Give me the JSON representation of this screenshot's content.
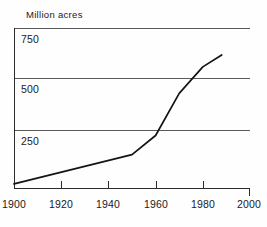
{
  "chart_data": {
    "type": "line",
    "title": "Million acres",
    "xlabel": "",
    "ylabel": "Million acres",
    "xlim": [
      1900,
      2000
    ],
    "ylim": [
      0,
      875
    ],
    "grid": true,
    "legend": null,
    "x_ticks": [
      1900,
      1920,
      1940,
      1960,
      1980,
      2000
    ],
    "x_tick_labels": [
      "1900",
      "1920",
      "1940",
      "1960",
      "1980",
      "2000"
    ],
    "y_gridlines": [
      250,
      500,
      750
    ],
    "y_tick_labels": [
      "250",
      "500",
      "750"
    ],
    "series": [
      {
        "name": "Million acres",
        "x": [
          1900,
          1950,
          1960,
          1970,
          1980,
          1988
        ],
        "values": [
          25,
          185,
          290,
          520,
          665,
          730
        ]
      }
    ]
  },
  "axis": {
    "y_labels": [
      {
        "text": "750",
        "value": 750
      },
      {
        "text": "500",
        "value": 500
      },
      {
        "text": "250",
        "value": 250
      }
    ],
    "x_labels": [
      {
        "text": "1900",
        "value": 1900
      },
      {
        "text": "1920",
        "value": 1920
      },
      {
        "text": "1940",
        "value": 1940
      },
      {
        "text": "1960",
        "value": 1960
      },
      {
        "text": "1980",
        "value": 1980
      },
      {
        "text": "2000",
        "value": 2000
      }
    ]
  },
  "colors": {
    "line": "#141414",
    "grid": "#5a5a5a",
    "axis": "#2b2b2b",
    "background": "#fefefe",
    "text": "#1a1a1a"
  }
}
